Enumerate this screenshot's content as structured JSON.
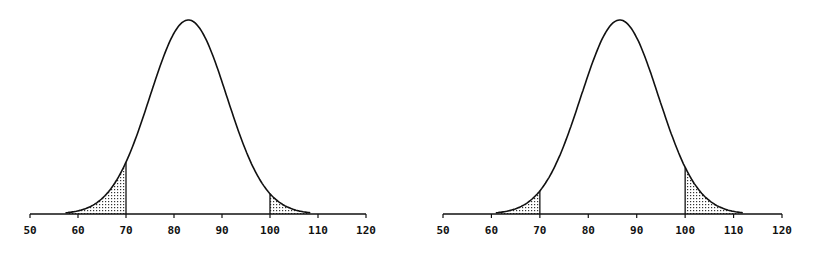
{
  "chart_data": [
    {
      "type": "area",
      "title": "",
      "xlabel": "",
      "ylabel": "",
      "distribution": "normal",
      "mean": 83,
      "sd": 8,
      "xlim": [
        50,
        120
      ],
      "xticks": [
        50,
        60,
        70,
        80,
        90,
        100,
        110,
        120
      ],
      "shaded_regions": [
        {
          "from": 58,
          "to": 70,
          "label": "lower tail"
        },
        {
          "from": 100,
          "to": 108,
          "label": "upper tail"
        }
      ],
      "markers": [
        70,
        100
      ],
      "grid": false,
      "legend": null
    },
    {
      "type": "area",
      "title": "",
      "xlabel": "",
      "ylabel": "",
      "distribution": "normal",
      "mean": 86.5,
      "sd": 8,
      "xlim": [
        50,
        120
      ],
      "xticks": [
        50,
        60,
        70,
        80,
        90,
        100,
        110,
        120
      ],
      "shaded_regions": [
        {
          "from": 62,
          "to": 70,
          "label": "lower tail"
        },
        {
          "from": 100,
          "to": 111,
          "label": "upper tail"
        }
      ],
      "markers": [
        70,
        100
      ],
      "grid": false,
      "legend": null
    }
  ],
  "layout": [
    {
      "axis_x0": 30,
      "axis_x1": 366,
      "axis_y": 214,
      "peak_height": 194
    },
    {
      "axis_x0": 443,
      "axis_x1": 782,
      "axis_y": 214,
      "peak_height": 194
    }
  ],
  "colors": {
    "line": "#111111",
    "fill_dots": "#333333",
    "background": "#ffffff"
  }
}
